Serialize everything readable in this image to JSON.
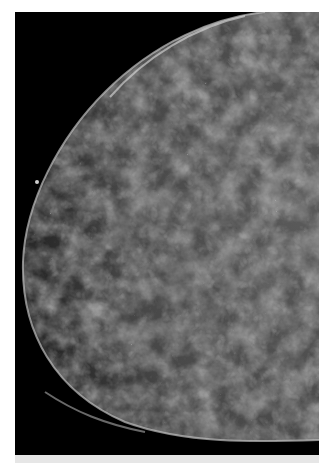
{
  "image": {
    "type": "mammogram",
    "description": "Grayscale breast X-ray (mammogram), breast tissue extending from the right edge with a curved skin boundary on the left",
    "colors": {
      "background": "#000000",
      "tissue_dark": "#3a3a3a",
      "tissue_mid": "#6b6b6b",
      "tissue_light": "#a8a8a8",
      "skin_line": "#d8d8d8",
      "page": "#ffffff",
      "bottom_strip": "#e6e6e6"
    }
  }
}
